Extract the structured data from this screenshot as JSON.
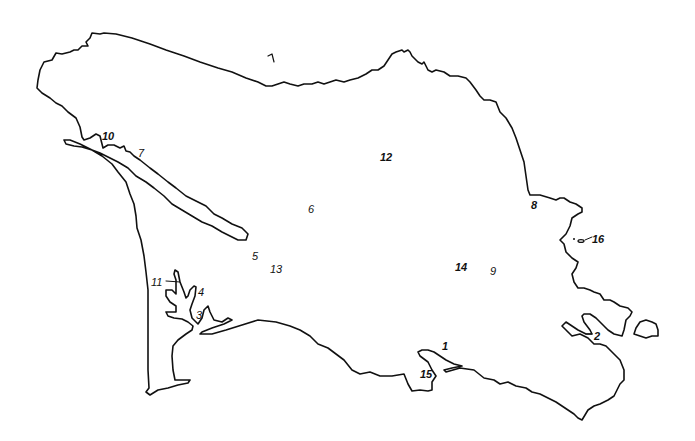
{
  "map": {
    "type": "outline-map",
    "background": "#ffffff",
    "line_color": "#111111",
    "labels": [
      {
        "id": "1",
        "text": "1",
        "x": 268,
        "y": 52,
        "bold": false,
        "note": "stroke-mark at top"
      },
      {
        "id": "10",
        "text": "10",
        "x": 102,
        "y": 131,
        "bold": true
      },
      {
        "id": "7",
        "text": "7",
        "x": 138,
        "y": 148,
        "bold": false
      },
      {
        "id": "12",
        "text": "12",
        "x": 380,
        "y": 152,
        "bold": true
      },
      {
        "id": "6",
        "text": "6",
        "x": 308,
        "y": 204,
        "bold": false
      },
      {
        "id": "8",
        "text": "8",
        "x": 531,
        "y": 200,
        "bold": true
      },
      {
        "id": "16",
        "text": "16",
        "x": 592,
        "y": 234,
        "bold": true
      },
      {
        "id": "5",
        "text": "5",
        "x": 252,
        "y": 251,
        "bold": false
      },
      {
        "id": "13",
        "text": "13",
        "x": 270,
        "y": 264,
        "bold": false
      },
      {
        "id": "14",
        "text": "14",
        "x": 455,
        "y": 262,
        "bold": true
      },
      {
        "id": "9",
        "text": "9",
        "x": 490,
        "y": 266,
        "bold": false
      },
      {
        "id": "11",
        "text": "11",
        "x": 151,
        "y": 277,
        "bold": false
      },
      {
        "id": "4",
        "text": "4",
        "x": 198,
        "y": 287,
        "bold": false
      },
      {
        "id": "3",
        "text": "3",
        "x": 196,
        "y": 310,
        "bold": false
      },
      {
        "id": "2",
        "text": "2",
        "x": 594,
        "y": 331,
        "bold": true
      },
      {
        "id": "1b",
        "text": "1",
        "x": 442,
        "y": 341,
        "bold": true
      },
      {
        "id": "15",
        "text": "15",
        "x": 420,
        "y": 369,
        "bold": true
      }
    ]
  }
}
